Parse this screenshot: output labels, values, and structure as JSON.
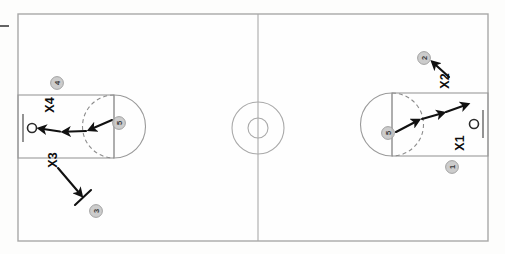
{
  "diagram": {
    "court": {
      "orientation": "horizontal-full-court",
      "background_color": "#fdfdfc",
      "line_color": "#a9a9a9",
      "outline": {
        "x": 18,
        "y": 14,
        "width": 470,
        "height": 227
      },
      "halfcourt_line_x": 258,
      "center_circle": {
        "cx": 258,
        "cy": 128,
        "outer_r": 26,
        "inner_r": 10
      }
    },
    "left_half": {
      "key": {
        "x": 18,
        "y": 95,
        "width": 96,
        "height": 63
      },
      "free_throw_line_x": 114,
      "solid_arc": "outer half-circle right of free throw line",
      "dashed_arc": "inner half-circle left of free throw line",
      "hoop": {
        "cx": 32,
        "cy": 128,
        "r": 4.5
      },
      "backboard": {
        "x": 23,
        "y1": 114,
        "y2": 142
      }
    },
    "right_half": {
      "key": {
        "x": 392,
        "y": 93,
        "width": 96,
        "height": 63
      },
      "free_throw_line_x": 392,
      "solid_arc": "outer half-circle left of free throw line",
      "dashed_arc": "inner half-circle right of free throw line",
      "hoop": {
        "cx": 474,
        "cy": 124,
        "r": 4.5
      },
      "backboard": {
        "x": 483,
        "y1": 110,
        "y2": 138
      }
    },
    "offense_players": [
      {
        "id": "o4-left",
        "number": "4",
        "cx": 57,
        "cy": 83,
        "side": "left",
        "note": "above left key, near free-throw lane"
      },
      {
        "id": "o5-left",
        "number": "5",
        "cx": 119,
        "cy": 123,
        "side": "left",
        "note": "ball handler at left free-throw line"
      },
      {
        "id": "o3-left",
        "number": "3",
        "cx": 96,
        "cy": 211,
        "side": "left",
        "note": "low wing below left key"
      },
      {
        "id": "o2-right",
        "number": "2",
        "cx": 424,
        "cy": 58,
        "side": "right",
        "note": "upper wing right side"
      },
      {
        "id": "o5-right",
        "number": "5",
        "cx": 388,
        "cy": 133,
        "side": "right",
        "note": "ball handler at right free-throw line"
      },
      {
        "id": "o1-right",
        "number": "1",
        "cx": 452,
        "cy": 167,
        "side": "right",
        "note": "below right key"
      }
    ],
    "defense_labels": [
      {
        "id": "x4",
        "text": "X4",
        "x": 50,
        "y": 105,
        "rotation": -90,
        "side": "left"
      },
      {
        "id": "x3",
        "text": "X3",
        "x": 53,
        "y": 160,
        "rotation": -90,
        "side": "left"
      },
      {
        "id": "x1",
        "text": "X1",
        "x": 460,
        "y": 143,
        "rotation": -90,
        "side": "right"
      },
      {
        "id": "x2",
        "text": "X2",
        "x": 445,
        "y": 81,
        "rotation": -90,
        "side": "right"
      }
    ],
    "movement_arrows": [
      {
        "id": "arrow-left-drive",
        "description": "Ball handler 5 drives left toward the left hoop (three chained arrowheads)",
        "type": "drive",
        "segments": [
          {
            "from": [
              112,
              120
            ],
            "to": [
              88,
              130
            ],
            "head": true
          },
          {
            "from": [
              88,
              130
            ],
            "to": [
              62,
              132
            ],
            "head": true
          },
          {
            "from": [
              62,
              132
            ],
            "to": [
              40,
              128
            ],
            "head": true
          }
        ]
      },
      {
        "id": "arrow-x3-screen",
        "description": "X3 cuts down-right to set a screen (arrow terminates in a perpendicular screen bar)",
        "type": "screen",
        "segments": [
          {
            "from": [
              58,
              168
            ],
            "to": [
              82,
              196
            ],
            "head": true
          }
        ],
        "screen_bar": {
          "from": [
            76,
            204
          ],
          "to": [
            90,
            191
          ]
        }
      },
      {
        "id": "arrow-right-drive",
        "description": "Ball handler 5 drives right toward the right hoop (three chained arrowheads)",
        "type": "drive",
        "segments": [
          {
            "from": [
              396,
              132
            ],
            "to": [
              420,
              120
            ],
            "head": true
          },
          {
            "from": [
              420,
              120
            ],
            "to": [
              444,
              112
            ],
            "head": true
          },
          {
            "from": [
              444,
              112
            ],
            "to": [
              468,
              104
            ],
            "head": true
          }
        ]
      },
      {
        "id": "arrow-x2-closeout",
        "description": "X2 closes out up-left toward offensive player 2",
        "type": "closeout",
        "segments": [
          {
            "from": [
              448,
              76
            ],
            "to": [
              432,
              62
            ],
            "head": true
          }
        ]
      }
    ],
    "edge_marks": [
      {
        "id": "left-edge-tick",
        "description": "small dark tick at far left margin",
        "x1": 0,
        "y1": 26,
        "x2": 9,
        "y2": 26
      }
    ]
  }
}
